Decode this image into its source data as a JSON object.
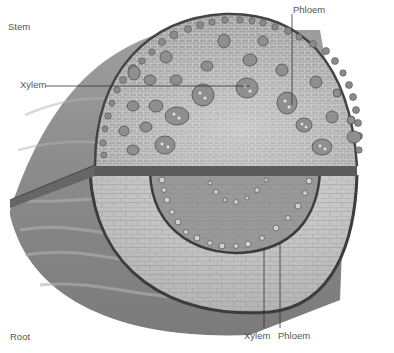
{
  "diagram": {
    "labels": {
      "stem": "Stem",
      "root": "Root",
      "stem_xylem": "Xylem",
      "stem_phloem": "Phloem",
      "root_xylem": "Xylem",
      "root_phloem": "Phloem"
    },
    "colors": {
      "background": "#ffffff",
      "cortex_light": "#c9c9c9",
      "cortex_mid": "#a7a7a7",
      "epidermis": "#4a4a4a",
      "bundle": "#8a8a8a",
      "outer_surface": "#8d8d8d",
      "label_text": "#555555"
    }
  }
}
